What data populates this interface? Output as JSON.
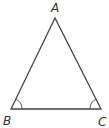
{
  "diagram": {
    "type": "triangle",
    "vertices": [
      {
        "label": "A",
        "x": 55,
        "y": 18
      },
      {
        "label": "B",
        "x": 11,
        "y": 109
      },
      {
        "label": "C",
        "x": 101,
        "y": 109
      }
    ],
    "angle_marks": [
      "B",
      "C"
    ],
    "stroke_color": "#444444"
  }
}
